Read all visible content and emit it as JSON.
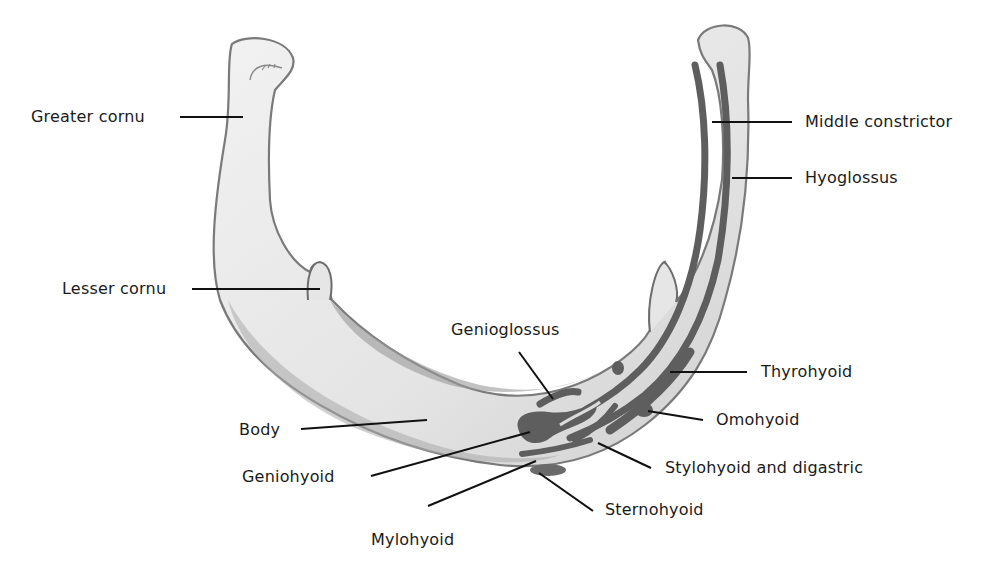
{
  "figure": {
    "colors": {
      "bone_fill": "#e8e8e8",
      "bone_shade": "#b8b8b8",
      "bone_outline": "#7a7a7a",
      "muscle_attachment": "#5e5e5e",
      "leader_line": "#111111",
      "label_text": "#1a1a1a"
    }
  },
  "labels": {
    "greater_cornu": "Greater cornu",
    "lesser_cornu": "Lesser cornu",
    "body": "Body",
    "geniohyoid": "Geniohyoid",
    "mylohyoid": "Mylohyoid",
    "genioglossus": "Genioglossus",
    "middle_constrictor": "Middle constrictor",
    "hyoglossus": "Hyoglossus",
    "thyrohyoid": "Thyrohyoid",
    "omohyoid": "Omohyoid",
    "stylohyoid_digastric": "Stylohyoid and digastric",
    "sternohyoid": "Sternohyoid"
  }
}
